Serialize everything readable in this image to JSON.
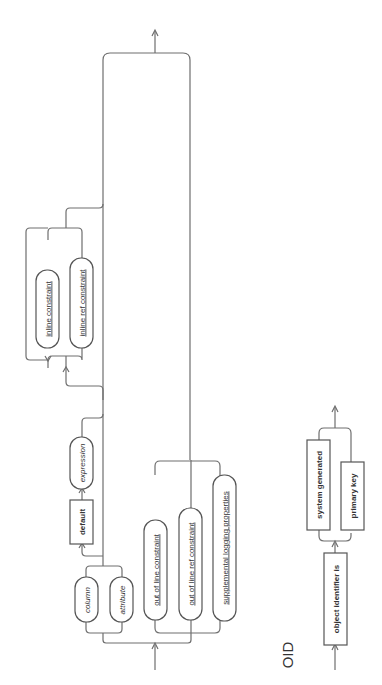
{
  "diagram": {
    "type": "syntax-railroad-diagram",
    "orientation": "rotated-90-ccw",
    "colors": {
      "line": "#6e6e6e",
      "border": "#555555",
      "text": "#333333",
      "background": "#ffffff"
    },
    "main": {
      "choice_column_or_attribute": [
        {
          "label": "column",
          "style": "italic",
          "shape": "pill"
        },
        {
          "label": "attribute",
          "style": "italic",
          "shape": "pill"
        }
      ],
      "default_keyword": {
        "label": "default",
        "style": "bold",
        "shape": "box"
      },
      "expression": {
        "label": "expression",
        "style": "italic",
        "shape": "pill"
      },
      "inline_constraints": [
        {
          "label": "inline constraint",
          "style": "underline",
          "shape": "pill",
          "repeatable": true
        },
        {
          "label": "inline ref constraint",
          "style": "underline",
          "shape": "pill"
        }
      ],
      "out_of_line": [
        {
          "label": "out of line constraint",
          "style": "underline",
          "shape": "pill"
        },
        {
          "label": "out of line ref constraint",
          "style": "underline",
          "shape": "pill"
        },
        {
          "label": "supplemental logging properties",
          "style": "underline",
          "shape": "pill"
        }
      ]
    },
    "oid": {
      "title": "OID",
      "keyword": {
        "label": "object identifier is",
        "style": "bold",
        "shape": "box"
      },
      "choices": [
        {
          "label": "system generated",
          "style": "bold",
          "shape": "box"
        },
        {
          "label": "primary key",
          "style": "bold",
          "shape": "box"
        }
      ]
    }
  }
}
